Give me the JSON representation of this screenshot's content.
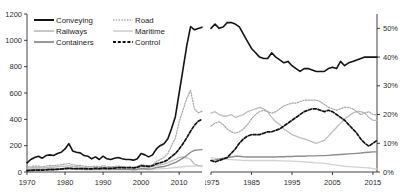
{
  "legend": {
    "items": [
      {
        "label": "Conveying",
        "style": "solid-thick-black",
        "color": "#141414"
      },
      {
        "label": "Road",
        "style": "dotted-gray",
        "color": "#9a9a9a"
      },
      {
        "label": "Railways",
        "style": "solid-light-gray",
        "color": "#b9b9b9"
      },
      {
        "label": "Maritime",
        "style": "solid-pale-gray",
        "color": "#cfcfcf"
      },
      {
        "label": "Containers",
        "style": "solid-mid-gray",
        "color": "#8a8a8a"
      },
      {
        "label": "Control",
        "style": "dashed-black",
        "color": "#111111"
      }
    ]
  },
  "chart_data": [
    {
      "id": "left-index-chart",
      "type": "line",
      "title": "",
      "xlabel": "",
      "ylabel": "",
      "xlim": [
        1970,
        2016
      ],
      "ylim": [
        0,
        1200
      ],
      "xticks": [
        1970,
        1980,
        1990,
        2000,
        2010
      ],
      "yticks": [
        0,
        200,
        400,
        600,
        800,
        1000,
        1200
      ],
      "ytick_labels": [
        "0",
        "200",
        "400",
        "600",
        "800",
        "1000",
        "1200"
      ],
      "grid": false,
      "legend_position": "top-left",
      "x": [
        1970,
        1971,
        1972,
        1973,
        1974,
        1975,
        1976,
        1977,
        1978,
        1979,
        1980,
        1981,
        1982,
        1983,
        1984,
        1985,
        1986,
        1987,
        1988,
        1989,
        1990,
        1991,
        1992,
        1993,
        1994,
        1995,
        1996,
        1997,
        1998,
        1999,
        2000,
        2001,
        2002,
        2003,
        2004,
        2005,
        2006,
        2007,
        2008,
        2009,
        2010,
        2011,
        2012,
        2013,
        2014,
        2015,
        2016
      ],
      "series": [
        {
          "name": "Conveying",
          "values": [
            70,
            95,
            110,
            120,
            105,
            125,
            130,
            125,
            140,
            150,
            175,
            215,
            160,
            150,
            145,
            125,
            120,
            100,
            115,
            95,
            120,
            100,
            95,
            105,
            110,
            100,
            95,
            95,
            90,
            100,
            140,
            130,
            115,
            130,
            175,
            200,
            215,
            250,
            330,
            420,
            600,
            780,
            960,
            1105,
            1080,
            1090,
            1100
          ]
        },
        {
          "name": "Road",
          "values": [
            35,
            40,
            45,
            45,
            40,
            45,
            50,
            48,
            52,
            55,
            60,
            65,
            55,
            50,
            50,
            45,
            42,
            40,
            45,
            40,
            48,
            42,
            40,
            42,
            45,
            42,
            40,
            40,
            38,
            42,
            55,
            52,
            48,
            55,
            80,
            95,
            110,
            140,
            200,
            260,
            380,
            470,
            560,
            620,
            480,
            450,
            460
          ]
        },
        {
          "name": "Railways",
          "values": [
            30,
            32,
            35,
            35,
            32,
            35,
            38,
            36,
            40,
            42,
            45,
            48,
            42,
            40,
            38,
            35,
            33,
            32,
            35,
            32,
            36,
            33,
            32,
            33,
            35,
            33,
            32,
            32,
            30,
            33,
            40,
            38,
            35,
            40,
            50,
            55,
            60,
            70,
            85,
            95,
            110,
            115,
            108,
            95,
            60,
            48,
            45
          ]
        },
        {
          "name": "Containers",
          "values": [
            18,
            20,
            22,
            22,
            20,
            22,
            24,
            23,
            25,
            26,
            28,
            30,
            27,
            25,
            24,
            22,
            21,
            20,
            22,
            20,
            23,
            21,
            20,
            21,
            22,
            21,
            20,
            20,
            19,
            21,
            26,
            25,
            23,
            26,
            34,
            38,
            42,
            50,
            62,
            72,
            88,
            105,
            125,
            150,
            165,
            168,
            170
          ]
        },
        {
          "name": "Maritime",
          "values": [
            15,
            16,
            17,
            17,
            16,
            17,
            18,
            17,
            19,
            20,
            21,
            22,
            20,
            19,
            18,
            17,
            16,
            16,
            17,
            16,
            18,
            16,
            16,
            16,
            17,
            16,
            16,
            16,
            15,
            16,
            19,
            18,
            17,
            19,
            22,
            24,
            26,
            28,
            32,
            34,
            38,
            40,
            42,
            44,
            44,
            45,
            45
          ]
        },
        {
          "name": "Control",
          "values": [
            10,
            12,
            14,
            15,
            14,
            16,
            18,
            18,
            20,
            22,
            25,
            28,
            26,
            25,
            26,
            25,
            24,
            24,
            28,
            26,
            30,
            28,
            28,
            30,
            34,
            33,
            32,
            33,
            32,
            36,
            48,
            45,
            42,
            48,
            62,
            70,
            78,
            92,
            118,
            140,
            175,
            215,
            260,
            310,
            355,
            385,
            400
          ]
        }
      ]
    },
    {
      "id": "right-share-chart",
      "type": "line",
      "title": "",
      "xlabel": "",
      "ylabel": "",
      "xlim": [
        1975,
        2016
      ],
      "ylim": [
        0,
        55
      ],
      "xticks": [
        1975,
        1985,
        1995,
        2005,
        2015
      ],
      "yticks": [
        0,
        10,
        20,
        30,
        40,
        50
      ],
      "ytick_labels": [
        "0%",
        "10%",
        "20%",
        "30%",
        "40%",
        "50%"
      ],
      "yaxis_side": "right",
      "grid": false,
      "x": [
        1975,
        1976,
        1977,
        1978,
        1979,
        1980,
        1981,
        1982,
        1983,
        1984,
        1985,
        1986,
        1987,
        1988,
        1989,
        1990,
        1991,
        1992,
        1993,
        1994,
        1995,
        1996,
        1997,
        1998,
        1999,
        2000,
        2001,
        2002,
        2003,
        2004,
        2005,
        2006,
        2007,
        2008,
        2009,
        2010,
        2011,
        2012,
        2013,
        2014,
        2015,
        2016
      ],
      "series": [
        {
          "name": "Conveying",
          "values": [
            50.0,
            51.5,
            50.0,
            50.5,
            52.0,
            52.0,
            51.5,
            50.5,
            48.0,
            45.5,
            43.0,
            41.5,
            40.0,
            39.5,
            39.5,
            41.5,
            40.0,
            39.0,
            38.0,
            38.5,
            37.0,
            36.0,
            35.0,
            36.0,
            36.0,
            35.5,
            35.0,
            35.0,
            35.0,
            36.0,
            36.5,
            36.0,
            38.5,
            37.0,
            38.0,
            38.5,
            39.0,
            39.5,
            40.0,
            40.0,
            40.0,
            40.0
          ]
        },
        {
          "name": "Railways",
          "values": [
            20.5,
            21.0,
            20.0,
            19.5,
            19.5,
            20.0,
            19.0,
            19.5,
            20.0,
            21.0,
            21.5,
            22.0,
            22.5,
            22.0,
            21.0,
            19.0,
            17.5,
            16.5,
            15.0,
            14.0,
            13.0,
            12.5,
            12.0,
            11.5,
            11.0,
            10.5,
            10.0,
            10.5,
            11.0,
            12.5,
            14.0,
            15.5,
            17.0,
            18.5,
            19.5,
            20.5,
            21.0,
            21.0,
            20.5,
            19.0,
            18.0,
            18.0
          ]
        },
        {
          "name": "Road",
          "values": [
            16.0,
            17.0,
            17.5,
            16.5,
            15.0,
            14.0,
            13.5,
            14.0,
            15.0,
            16.5,
            18.5,
            20.0,
            21.0,
            21.5,
            21.0,
            20.5,
            21.0,
            22.0,
            23.0,
            23.5,
            24.0,
            24.0,
            24.5,
            25.0,
            25.0,
            25.0,
            25.0,
            24.5,
            23.5,
            22.5,
            22.0,
            21.5,
            22.0,
            22.5,
            22.5,
            22.0,
            21.0,
            20.0,
            20.5,
            21.0,
            20.0,
            20.0
          ]
        },
        {
          "name": "Control",
          "values": [
            4.0,
            3.5,
            4.0,
            4.5,
            5.0,
            6.5,
            8.0,
            10.0,
            11.5,
            12.5,
            13.0,
            13.0,
            13.0,
            13.5,
            14.0,
            14.0,
            14.5,
            15.0,
            16.0,
            17.0,
            18.0,
            19.0,
            20.0,
            21.0,
            21.5,
            22.0,
            22.0,
            21.5,
            21.0,
            21.5,
            21.0,
            20.0,
            19.0,
            18.0,
            16.5,
            15.0,
            13.5,
            11.5,
            10.0,
            9.0,
            10.0,
            11.0
          ]
        },
        {
          "name": "Containers",
          "values": [
            4.0,
            4.2,
            4.5,
            4.8,
            5.0,
            5.2,
            5.5,
            5.5,
            5.3,
            5.2,
            5.2,
            5.2,
            5.2,
            5.2,
            5.2,
            5.2,
            5.2,
            5.3,
            5.3,
            5.4,
            5.4,
            5.5,
            5.5,
            5.5,
            5.6,
            5.6,
            5.6,
            5.7,
            5.7,
            5.8,
            5.9,
            6.0,
            6.1,
            6.2,
            6.3,
            6.4,
            6.5,
            6.6,
            6.8,
            6.9,
            7.0,
            7.0
          ]
        },
        {
          "name": "Maritime",
          "values": [
            5.0,
            4.8,
            4.6,
            4.5,
            4.4,
            4.3,
            4.2,
            4.1,
            4.0,
            4.0,
            4.0,
            4.0,
            4.0,
            4.0,
            4.0,
            4.0,
            4.0,
            3.9,
            3.9,
            3.8,
            3.8,
            3.7,
            3.6,
            3.5,
            3.4,
            3.3,
            3.2,
            3.1,
            3.0,
            2.8,
            2.6,
            2.4,
            2.2,
            2.0,
            1.9,
            1.8,
            1.7,
            1.6,
            1.5,
            1.4,
            1.2,
            1.0
          ]
        }
      ]
    }
  ]
}
